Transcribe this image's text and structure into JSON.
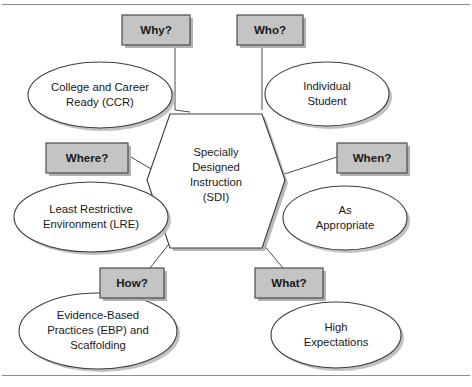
{
  "figure": {
    "center": {
      "lines": [
        "Specially",
        "Designed",
        "Instruction",
        "(SDI)"
      ],
      "shape": "hexagon"
    },
    "branches": [
      {
        "key": "why",
        "question": "Why?",
        "answer_lines": [
          "College and Career",
          "Ready (CCR)"
        ],
        "position": "top-left"
      },
      {
        "key": "who",
        "question": "Who?",
        "answer_lines": [
          "Individual",
          "Student"
        ],
        "position": "top-right"
      },
      {
        "key": "where",
        "question": "Where?",
        "answer_lines": [
          "Least Restrictive",
          "Environment (LRE)"
        ],
        "position": "middle-left"
      },
      {
        "key": "when",
        "question": "When?",
        "answer_lines": [
          "As",
          "Appropriate"
        ],
        "position": "middle-right"
      },
      {
        "key": "how",
        "question": "How?",
        "answer_lines": [
          "Evidence-Based",
          "Practices (EBP) and",
          "Scaffolding"
        ],
        "position": "bottom-left"
      },
      {
        "key": "what",
        "question": "What?",
        "answer_lines": [
          "High",
          "Expectations"
        ],
        "position": "bottom-right"
      }
    ],
    "colors": {
      "label_box_fill": "#c4c4c4",
      "label_box_border": "#4c4c4c",
      "shape_fill": "#ffffff",
      "shape_border": "#3c3c3c",
      "connector": "#4a4a4a",
      "rule": "#8d8d8d",
      "shadow": "#b0b0b0",
      "text": "#1a1a1a",
      "background": "#ffffff"
    }
  }
}
